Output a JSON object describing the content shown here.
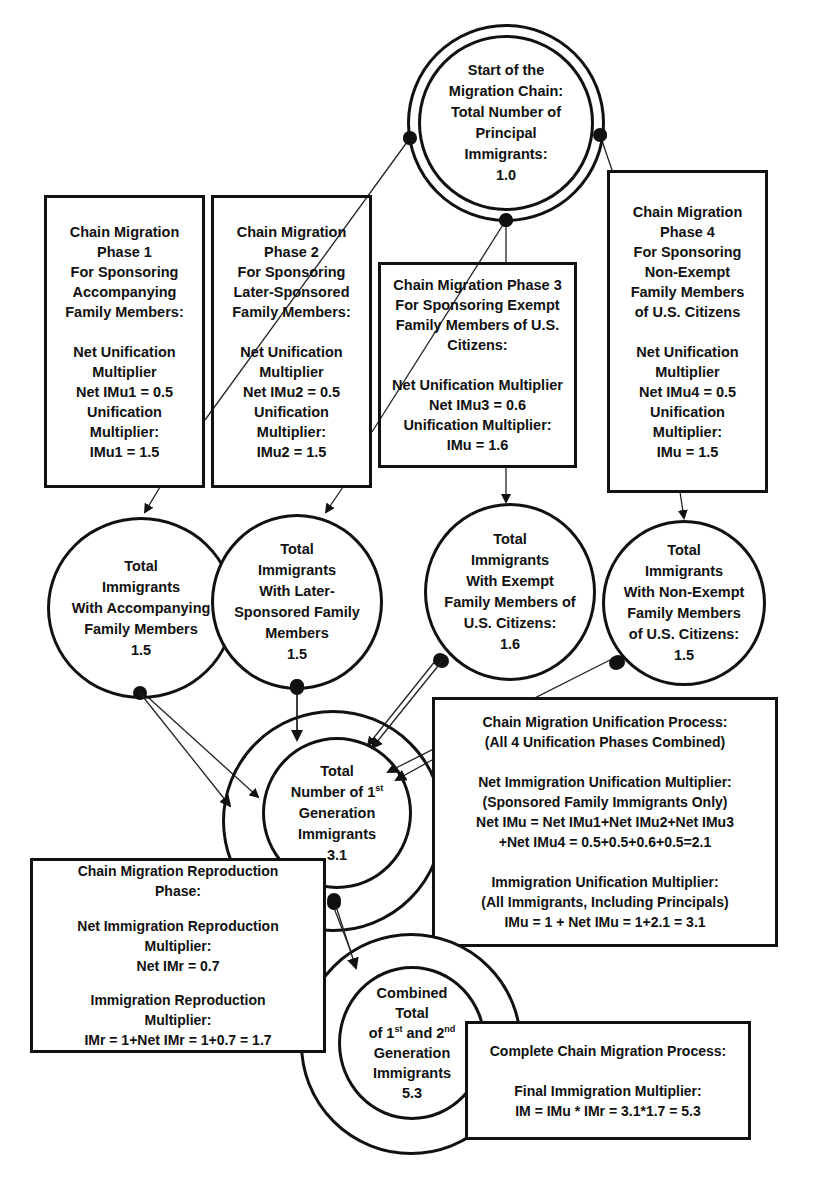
{
  "start_node": {
    "lines": [
      "Start of the",
      "Migration Chain:",
      "Total Number of",
      "Principal",
      "Immigrants:",
      "1.0"
    ]
  },
  "phase_boxes": [
    {
      "title_lines": [
        "Chain Migration",
        "Phase 1",
        "For Sponsoring",
        "Accompanying",
        "Family Members:"
      ],
      "body_lines": [
        "Net Unification",
        "Multiplier",
        "Net IMu1 = 0.5",
        "Unification",
        "Multiplier:",
        "IMu1 = 1.5"
      ]
    },
    {
      "title_lines": [
        "Chain Migration",
        "Phase 2",
        "For Sponsoring",
        "Later-Sponsored",
        "Family Members:"
      ],
      "body_lines": [
        "Net Unification",
        "Multiplier",
        "Net IMu2 = 0.5",
        "Unification",
        "Multiplier:",
        "IMu2 = 1.5"
      ]
    },
    {
      "title_lines": [
        "Chain Migration Phase 3",
        "For Sponsoring Exempt",
        "Family Members of U.S.",
        "Citizens:"
      ],
      "body_lines": [
        "Net Unification Multiplier",
        "Net IMu3 = 0.6",
        "Unification Multiplier:",
        "IMu = 1.6"
      ]
    },
    {
      "title_lines": [
        "Chain Migration",
        "Phase 4",
        "For Sponsoring",
        "Non-Exempt",
        "Family Members",
        "of U.S. Citizens"
      ],
      "body_lines": [
        "Net Unification",
        "Multiplier",
        "Net IMu4 = 0.5",
        "Unification",
        "Multiplier:",
        "IMu = 1.5"
      ]
    }
  ],
  "phase_circles": [
    {
      "lines": [
        "Total",
        "Immigrants",
        "With Accompanying",
        "Family Members",
        "1.5"
      ]
    },
    {
      "lines": [
        "Total",
        "Immigrants",
        "With Later-",
        "Sponsored Family",
        "Members",
        "1.5"
      ]
    },
    {
      "lines": [
        "Total",
        "Immigrants",
        "With Exempt",
        "Family Members of",
        "U.S. Citizens:",
        "1.6"
      ]
    },
    {
      "lines": [
        "Total",
        "Immigrants",
        "With Non-Exempt",
        "Family Members",
        "of U.S. Citizens:",
        "1.5"
      ]
    }
  ],
  "first_gen_node": {
    "line1": "Total",
    "line2_pre": "Number of 1",
    "line2_sup": "st",
    "line3": "Generation",
    "line4": "Immigrants",
    "value": "3.1"
  },
  "unification_box": {
    "title_lines": [
      "Chain Migration Unification Process:",
      "(All 4 Unification Phases Combined)"
    ],
    "net_lines": [
      "Net Immigration Unification Multiplier:",
      "(Sponsored Family Immigrants Only)",
      "Net IMu = Net IMu1+Net IMu2+Net IMu3",
      "+Net IMu4 = 0.5+0.5+0.6+0.5=2.1"
    ],
    "total_lines": [
      "Immigration Unification Multiplier:",
      "(All Immigrants, Including Principals)",
      "IMu = 1 + Net IMu = 1+2.1 = 3.1"
    ]
  },
  "reproduction_box": {
    "title_lines": [
      "Chain Migration Reproduction",
      "Phase:"
    ],
    "net_lines": [
      "Net Immigration Reproduction",
      "Multiplier:",
      "Net IMr = 0.7"
    ],
    "total_lines": [
      "Immigration Reproduction",
      "Multiplier:",
      "IMr = 1+Net IMr = 1+0.7 = 1.7"
    ]
  },
  "combined_node": {
    "line1": "Combined",
    "line2": "Total",
    "line3_a": "of 1",
    "line3_sup1": "st",
    "line3_b": " and 2",
    "line3_sup2": "nd",
    "line4": "Generation",
    "line5": "Immigrants",
    "value": "5.3"
  },
  "complete_box": {
    "title": "Complete Chain Migration Process:",
    "lines": [
      "Final Immigration Multiplier:",
      "IM = IMu * IMr = 3.1*1.7 = 5.3"
    ]
  }
}
